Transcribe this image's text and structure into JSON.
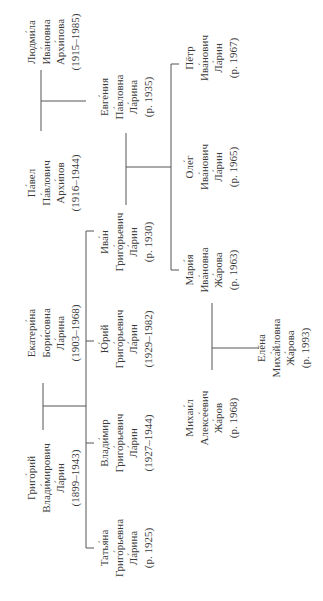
{
  "diagram": {
    "type": "family-tree",
    "orientation": "rotated-90-ccw",
    "line_color": "#555555",
    "text_color": "#3a3a3a"
  },
  "people": {
    "lyudmila": {
      "given": "Людми́ла",
      "patronymic": "Ива́новна",
      "surname": "Архи́пова",
      "dates": "(1915–1985)",
      "cx": 53,
      "cy": 42
    },
    "pavel": {
      "given": "Па́вел",
      "patronymic": "Па́влович",
      "surname": "Архи́пов",
      "dates": "(1916–1944)",
      "cx": 53,
      "cy": 183
    },
    "evgenia": {
      "given": "Евге́ния",
      "patronymic": "Па́вловна",
      "surname": "Ла́рина",
      "dates": "(р. 1935)",
      "cx": 126,
      "cy": 97
    },
    "ivan": {
      "given": "Ива́н",
      "patronymic": "Григо́рьевич",
      "surname": "Ла́рин",
      "dates": "(р. 1930)",
      "cx": 126,
      "cy": 242
    },
    "pyotr": {
      "given": "Пётр",
      "patronymic": "Ива́нович",
      "surname": "Ла́рин",
      "dates": "(р. 1967)",
      "cx": 211,
      "cy": 58
    },
    "oleg": {
      "given": "Оле́г",
      "patronymic": "Ива́нович",
      "surname": "Ла́рин",
      "dates": "(р. 1965)",
      "cx": 211,
      "cy": 167
    },
    "maria": {
      "given": "Мари́я",
      "patronymic": "Ива́новна",
      "surname": "Жа́рова",
      "dates": "(р. 1963)",
      "cx": 211,
      "cy": 270
    },
    "ekaterina": {
      "given": "Екатери́на",
      "patronymic": "Бори́совна",
      "surname": "Ла́рина",
      "dates": "(1903–1968)",
      "cx": 53,
      "cy": 333
    },
    "yuri": {
      "given": "Ю́рий",
      "patronymic": "Григо́рьевич",
      "surname": "Ла́рин",
      "dates": "(1929–1982)",
      "cx": 126,
      "cy": 339
    },
    "grigory": {
      "given": "Григо́рий",
      "patronymic": "Влади́мирович",
      "surname": "Ла́рин",
      "dates": "(1899–1943)",
      "cx": 53,
      "cy": 478
    },
    "vladimir": {
      "given": "Влади́мир",
      "patronymic": "Григо́рьевич",
      "surname": "Ла́рин",
      "dates": "(1927–1944)",
      "cx": 126,
      "cy": 443
    },
    "tatyana": {
      "given": "Татья́на",
      "patronymic": "Григо́рьевна",
      "surname": "Ла́рина",
      "dates": "(р. 1925)",
      "cx": 126,
      "cy": 548
    },
    "mikhail": {
      "given": "Михаи́л",
      "patronymic": "Алексе́евич",
      "surname": "Жа́ров",
      "dates": "(р. 1968)",
      "cx": 211,
      "cy": 418
    },
    "elena": {
      "given": "Елёна",
      "patronymic": "Миха́йловна",
      "surname": "Жа́рова",
      "dates": "(р. 1993)",
      "cx": 283,
      "cy": 348
    }
  },
  "relations": [
    {
      "type": "marriage",
      "a": "lyudmila",
      "b": "pavel",
      "children": [
        "evgenia"
      ]
    },
    {
      "type": "marriage",
      "a": "ekaterina",
      "b": "grigory",
      "children": [
        "ivan",
        "yuri",
        "vladimir",
        "tatyana"
      ]
    },
    {
      "type": "marriage",
      "a": "evgenia",
      "b": "ivan",
      "children": [
        "pyotr",
        "oleg",
        "maria"
      ]
    },
    {
      "type": "marriage",
      "a": "maria",
      "b": "mikhail",
      "children": [
        "elena"
      ]
    }
  ]
}
